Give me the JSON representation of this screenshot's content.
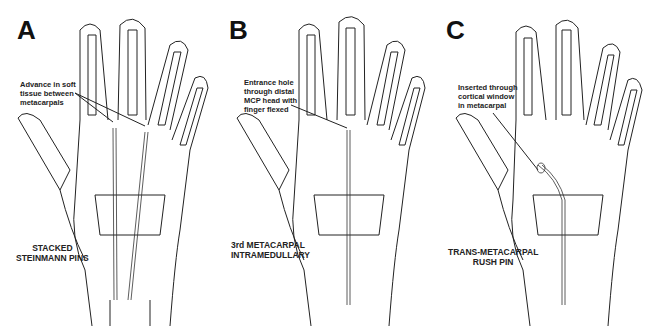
{
  "figure": {
    "panels": [
      {
        "letter": "A",
        "callout": [
          "Advance in soft",
          "tissue between",
          "metacarpals"
        ],
        "caption": [
          "STACKED",
          "STEINMANN PINS"
        ]
      },
      {
        "letter": "B",
        "callout": [
          "Entrance hole",
          "through distal",
          "MCP head with",
          "finger flexed"
        ],
        "caption": [
          "3rd METACARPAL",
          "INTRAMEDULLARY"
        ]
      },
      {
        "letter": "C",
        "callout": [
          "Inserted through",
          "cortical window",
          "in metacarpal"
        ],
        "caption": [
          "TRANS-METACARPAL",
          "RUSH PIN"
        ]
      }
    ],
    "colors": {
      "line": "#222222",
      "background": "#ffffff"
    }
  }
}
